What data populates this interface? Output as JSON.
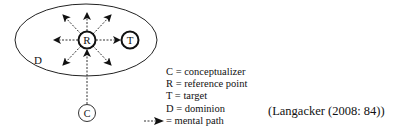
{
  "diagram": {
    "nodes": {
      "reference_point": {
        "label": "R"
      },
      "target": {
        "label": "T"
      },
      "conceptualizer": {
        "label": "C"
      },
      "dominion": {
        "label": "D"
      }
    },
    "arrow_directions": [
      "up-left",
      "up",
      "up-right",
      "left",
      "right-to-target",
      "down-left",
      "down-right"
    ],
    "incoming_path": "conceptualizer-to-reference-point"
  },
  "legend": {
    "items": [
      {
        "key": "C",
        "text": "C = conceptualizer"
      },
      {
        "key": "R",
        "text": "R = reference point"
      },
      {
        "key": "T",
        "text": "T = target"
      },
      {
        "key": "D",
        "text": "D = dominion"
      },
      {
        "key": "arrow",
        "icon": "dashed-arrow-icon",
        "text": "= mental path"
      }
    ]
  },
  "citation": "(Langacker (2008: 84))"
}
